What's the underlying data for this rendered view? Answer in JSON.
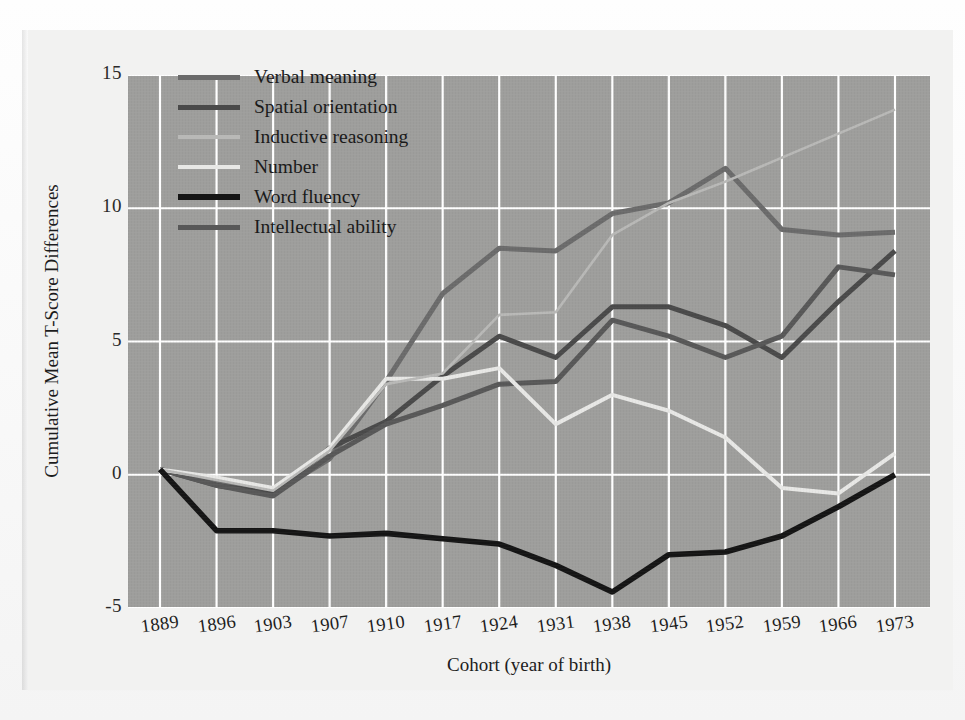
{
  "chart_data": {
    "type": "line",
    "title": "",
    "xlabel": "Cohort (year of birth)",
    "ylabel": "Cumulative Mean T-Score Differences",
    "categories": [
      "1889",
      "1896",
      "1903",
      "1907",
      "1910",
      "1917",
      "1924",
      "1931",
      "1938",
      "1945",
      "1952",
      "1959",
      "1966",
      "1973"
    ],
    "xtick_labels": [
      "1889",
      "1896",
      "1903",
      "1907",
      "1910",
      "1917",
      "1924",
      "1931",
      "1938",
      "1945",
      "1952",
      "1959",
      "1966",
      "1973"
    ],
    "ytick_labels": [
      "15",
      "10",
      "5",
      "0",
      "-5"
    ],
    "ytick_values": [
      15,
      10,
      5,
      0,
      -5
    ],
    "ylim": [
      -5,
      15
    ],
    "xlim_index": [
      0,
      13
    ],
    "grid": true,
    "grid_color": "#ffffff",
    "plot_bg": "#9e9e9c",
    "legend_position": "top-left",
    "series": [
      {
        "name": "Verbal meaning",
        "color": "#6b6b6b",
        "width": 5.0,
        "values": [
          0.2,
          -0.3,
          -0.7,
          0.6,
          3.5,
          6.8,
          8.5,
          8.4,
          9.8,
          10.2,
          11.5,
          9.2,
          9.0,
          9.1
        ]
      },
      {
        "name": "Spatial orientation",
        "color": "#4a4a4a",
        "width": 5.0,
        "values": [
          0.2,
          -0.4,
          -0.7,
          1.0,
          2.0,
          3.7,
          5.2,
          4.4,
          6.3,
          6.3,
          5.6,
          4.4,
          6.5,
          8.4
        ]
      },
      {
        "name": "Inductive reasoning",
        "color": "#b9b9b7",
        "width": 2.6,
        "values": [
          0.2,
          -0.2,
          -0.6,
          0.9,
          3.4,
          3.8,
          6.0,
          6.1,
          9.0,
          10.2,
          11.0,
          11.9,
          12.8,
          13.7
        ]
      },
      {
        "name": "Number",
        "color": "#e8e8e6",
        "width": 4.0,
        "values": [
          0.2,
          -0.1,
          -0.5,
          1.0,
          3.6,
          3.6,
          4.0,
          1.9,
          3.0,
          2.4,
          1.4,
          -0.5,
          -0.7,
          0.8
        ]
      },
      {
        "name": "Word fluency",
        "color": "#151515",
        "width": 5.6,
        "values": [
          0.2,
          -2.1,
          -2.1,
          -2.3,
          -2.2,
          -2.4,
          -2.6,
          -3.4,
          -4.4,
          -3.0,
          -2.9,
          -2.3,
          -1.2,
          0.0
        ]
      },
      {
        "name": "Intellectual ability",
        "color": "#585858",
        "width": 5.0,
        "values": [
          0.2,
          -0.4,
          -0.8,
          0.7,
          1.9,
          2.6,
          3.4,
          3.5,
          5.8,
          5.2,
          4.4,
          5.2,
          7.8,
          7.5
        ]
      }
    ]
  },
  "axes": {
    "y_label": "Cumulative Mean T-Score Differences",
    "x_label": "Cohort (year of birth)"
  },
  "legend": {
    "items": [
      {
        "label": "Verbal meaning"
      },
      {
        "label": "Spatial orientation"
      },
      {
        "label": "Inductive reasoning"
      },
      {
        "label": "Number"
      },
      {
        "label": "Word fluency"
      },
      {
        "label": "Intellectual ability"
      }
    ]
  }
}
